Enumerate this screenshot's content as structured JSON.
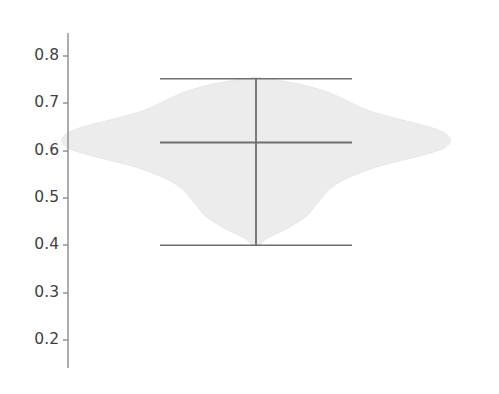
{
  "figure": {
    "background_color": "#ffffff",
    "width": 499,
    "height": 394
  },
  "axis": {
    "name": "y-axis",
    "spine_color": "#8c8c8c",
    "tick_color": "#8c8c8c",
    "label_color": "#3f3f3f",
    "ticks": [
      {
        "value": "0.8",
        "y": 56
      },
      {
        "value": "0.7",
        "y": 103
      },
      {
        "value": "0.6",
        "y": 151
      },
      {
        "value": "0.5",
        "y": 198
      },
      {
        "value": "0.4",
        "y": 245
      },
      {
        "value": "0.3",
        "y": 293
      },
      {
        "value": "0.2",
        "y": 340
      }
    ]
  },
  "chart_data": {
    "type": "violin",
    "title": "",
    "xlabel": "",
    "ylabel": "",
    "orientation": "vertical-value-horizontal-density",
    "grid": false,
    "legend": null,
    "ylim": [
      0.16,
      0.84
    ],
    "yticks": [
      0.2,
      0.3,
      0.4,
      0.5,
      0.6,
      0.7,
      0.8
    ],
    "series": [
      {
        "name": "distribution",
        "violin_fill": "#ececec",
        "violin_edge": "#e2e2e2",
        "line_color": "#6e6e6e",
        "median": 0.617,
        "whisker_min": 0.4,
        "whisker_max": 0.752,
        "center_line_value_range": [
          0.4,
          0.752
        ],
        "density_profile": [
          {
            "value": 0.755,
            "width": 0.0
          },
          {
            "value": 0.745,
            "width": 0.17
          },
          {
            "value": 0.735,
            "width": 0.28
          },
          {
            "value": 0.725,
            "width": 0.36
          },
          {
            "value": 0.715,
            "width": 0.42
          },
          {
            "value": 0.705,
            "width": 0.47
          },
          {
            "value": 0.695,
            "width": 0.52
          },
          {
            "value": 0.685,
            "width": 0.58
          },
          {
            "value": 0.675,
            "width": 0.66
          },
          {
            "value": 0.665,
            "width": 0.75
          },
          {
            "value": 0.655,
            "width": 0.85
          },
          {
            "value": 0.645,
            "width": 0.93
          },
          {
            "value": 0.635,
            "width": 0.98
          },
          {
            "value": 0.625,
            "width": 1.0
          },
          {
            "value": 0.617,
            "width": 1.0
          },
          {
            "value": 0.605,
            "width": 0.97
          },
          {
            "value": 0.595,
            "width": 0.9
          },
          {
            "value": 0.585,
            "width": 0.81
          },
          {
            "value": 0.575,
            "width": 0.71
          },
          {
            "value": 0.565,
            "width": 0.62
          },
          {
            "value": 0.555,
            "width": 0.55
          },
          {
            "value": 0.545,
            "width": 0.49
          },
          {
            "value": 0.535,
            "width": 0.44
          },
          {
            "value": 0.525,
            "width": 0.4
          },
          {
            "value": 0.515,
            "width": 0.37
          },
          {
            "value": 0.505,
            "width": 0.35
          },
          {
            "value": 0.495,
            "width": 0.33
          },
          {
            "value": 0.485,
            "width": 0.31
          },
          {
            "value": 0.475,
            "width": 0.29
          },
          {
            "value": 0.465,
            "width": 0.27
          },
          {
            "value": 0.455,
            "width": 0.24
          },
          {
            "value": 0.445,
            "width": 0.2
          },
          {
            "value": 0.435,
            "width": 0.16
          },
          {
            "value": 0.425,
            "width": 0.11
          },
          {
            "value": 0.415,
            "width": 0.06
          },
          {
            "value": 0.405,
            "width": 0.03
          },
          {
            "value": 0.4,
            "width": 0.02
          }
        ]
      }
    ]
  },
  "geometry": {
    "center_x": 256,
    "value_to_y": {
      "v_ref": 0.8,
      "y_ref": 56,
      "px_per_unit": 473
    },
    "violin_half_width_px": 194,
    "cap_half_width_px": 96,
    "spine_x": 68,
    "spine_y_top": 33,
    "spine_y_bottom": 368,
    "tick_len_px": 5
  }
}
